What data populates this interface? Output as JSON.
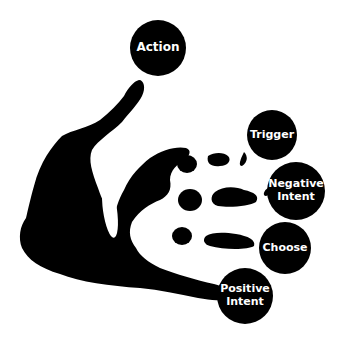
{
  "diagram": {
    "title": "",
    "colors": {
      "background": "#ffffff",
      "silhouette": "#000000",
      "label_text": "#ffffff"
    },
    "nodes": [
      {
        "id": "action",
        "label": "Action"
      },
      {
        "id": "trigger",
        "label": "Trigger"
      },
      {
        "id": "negative-intent",
        "label": "Negative\nIntent"
      },
      {
        "id": "choose",
        "label": "Choose"
      },
      {
        "id": "positive-intent",
        "label": "Positive\nIntent"
      }
    ],
    "figure": "hand-silhouette"
  }
}
